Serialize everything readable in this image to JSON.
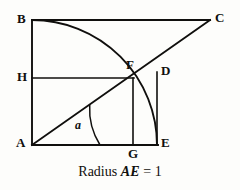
{
  "figure": {
    "background_color": "#fdfdfb",
    "stroke_color": "#100f0d",
    "caption": {
      "prefix": "Radius ",
      "emphasis": "AE",
      "suffix": " = 1"
    }
  },
  "points": {
    "A": {
      "label": "A",
      "x": 32,
      "y": 145,
      "label_x": 17,
      "label_y": 138
    },
    "B": {
      "label": "B",
      "x": 32,
      "y": 20,
      "label_x": 17,
      "label_y": 13
    },
    "C": {
      "label": "C",
      "x": 210,
      "y": 20,
      "label_x": 216,
      "label_y": 13
    },
    "D": {
      "label": "D",
      "x": 157,
      "y": 73,
      "label_x": 162,
      "label_y": 66
    },
    "E": {
      "label": "E",
      "x": 157,
      "y": 145,
      "label_x": 162,
      "label_y": 138
    },
    "F": {
      "label": "F",
      "x": 133,
      "y": 78,
      "label_x": 128,
      "label_y": 60
    },
    "G": {
      "label": "G",
      "x": 133,
      "y": 145,
      "label_x": 128,
      "label_y": 147
    },
    "H": {
      "label": "H",
      "x": 32,
      "y": 78,
      "label_x": 17,
      "label_y": 71
    }
  },
  "angle": {
    "label": "a",
    "vertex": "A",
    "label_x": 76,
    "label_y": 120,
    "arc_radius": 68,
    "degrees": 32
  },
  "segments": [
    {
      "name": "AB",
      "from": "A",
      "to": "B"
    },
    {
      "name": "BC",
      "from": "B",
      "to": "C"
    },
    {
      "name": "AC",
      "from": "A",
      "to": "C"
    },
    {
      "name": "AE",
      "from": "A",
      "to": "E"
    },
    {
      "name": "HF",
      "from": "H",
      "to": "F"
    },
    {
      "name": "FG",
      "from": "F",
      "to": "G"
    },
    {
      "name": "DE",
      "from": "D",
      "to": "E"
    }
  ],
  "arcs": [
    {
      "name": "quarter-circle-BE",
      "center": "A",
      "from": "B",
      "to": "E",
      "radius": 125
    },
    {
      "name": "angle-arc-a",
      "center": "A",
      "radius": 68
    }
  ]
}
